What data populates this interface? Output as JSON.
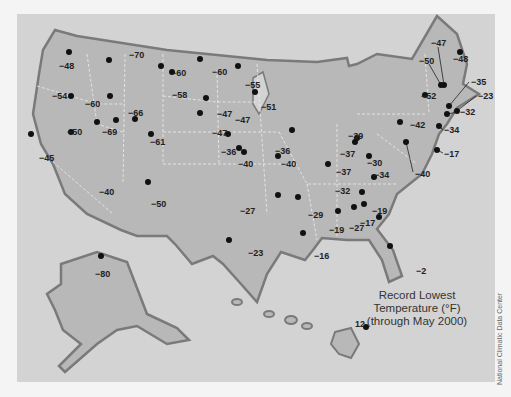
{
  "map": {
    "title_line1": "Record Lowest",
    "title_line2": "Temperature (°F)",
    "title_line3": "(through May 2000)",
    "credit": "National Climatic Data Center",
    "colors": {
      "background": "#f4f4f4",
      "ocean": "#d3d3d3",
      "land": "#b8b8b8",
      "border": "#7a7a7a",
      "marker": "#111111"
    }
  },
  "points": [
    {
      "v": "−48",
      "lx": 42,
      "ly": 48,
      "dx": 52,
      "dy": 38
    },
    {
      "v": "−54",
      "lx": 35,
      "ly": 78,
      "dx": 54,
      "dy": 82
    },
    {
      "v": "−60",
      "lx": 68,
      "ly": 86,
      "dx": 80,
      "dy": 108
    },
    {
      "v": "−70",
      "lx": 112,
      "ly": 37,
      "dx": 92,
      "dy": 46
    },
    {
      "v": "−60",
      "lx": 154,
      "ly": 55,
      "dx": 144,
      "dy": 52
    },
    {
      "v": "−66",
      "lx": 111,
      "ly": 95,
      "dx": 93,
      "dy": 82
    },
    {
      "v": "−58",
      "lx": 155,
      "ly": 77,
      "dx": 155,
      "dy": 58
    },
    {
      "v": "−60",
      "lx": 195,
      "ly": 54,
      "dx": 183,
      "dy": 45
    },
    {
      "v": "−55",
      "lx": 228,
      "ly": 67,
      "dx": 221,
      "dy": 52
    },
    {
      "v": "−51",
      "lx": 244,
      "ly": 89,
      "dx": 238,
      "dy": 78
    },
    {
      "v": "−47",
      "lx": 200,
      "ly": 96,
      "dx": 189,
      "dy": 84
    },
    {
      "v": "−47",
      "lx": 195,
      "ly": 115,
      "dx": 183,
      "dy": 99
    },
    {
      "v": "−36",
      "lx": 204,
      "ly": 134,
      "dx": 211,
      "dy": 120
    },
    {
      "v": "−50",
      "lx": 50,
      "ly": 114,
      "dx": 54,
      "dy": 118
    },
    {
      "v": "−45",
      "lx": 22,
      "ly": 140,
      "dx": 14,
      "dy": 120
    },
    {
      "v": "−69",
      "lx": 85,
      "ly": 114,
      "dx": 99,
      "dy": 106
    },
    {
      "v": "−61",
      "lx": 133,
      "ly": 124,
      "dx": 118,
      "dy": 105
    },
    {
      "v": "−40",
      "lx": 82,
      "ly": 174,
      "dx": 131,
      "dy": 168
    },
    {
      "v": "−50",
      "lx": 134,
      "ly": 186,
      "dx": 134,
      "dy": 120
    },
    {
      "v": "−47",
      "lx": 218,
      "ly": 102,
      "dx": 222,
      "dy": 134
    },
    {
      "v": "−40",
      "lx": 221,
      "ly": 146,
      "dx": 227,
      "dy": 138
    },
    {
      "v": "−40",
      "lx": 264,
      "ly": 146,
      "dx": 261,
      "dy": 142
    },
    {
      "v": "−36",
      "lx": 258,
      "ly": 133,
      "dx": 275,
      "dy": 116
    },
    {
      "v": "−39",
      "lx": 331,
      "ly": 118,
      "dx": 340,
      "dy": 124
    },
    {
      "v": "−37",
      "lx": 323,
      "ly": 136,
      "dx": 338,
      "dy": 128
    },
    {
      "v": "−37",
      "lx": 319,
      "ly": 154,
      "dx": 311,
      "dy": 150
    },
    {
      "v": "−42",
      "lx": 393,
      "ly": 107,
      "dx": 383,
      "dy": 108
    },
    {
      "v": "−30",
      "lx": 350,
      "ly": 145,
      "dx": 352,
      "dy": 142
    },
    {
      "v": "−40",
      "lx": 398,
      "ly": 156,
      "dx": 389,
      "dy": 128
    },
    {
      "v": "−17",
      "lx": 427,
      "ly": 136,
      "dx": 420,
      "dy": 136
    },
    {
      "v": "−34",
      "lx": 427,
      "ly": 112,
      "dx": 422,
      "dy": 112
    },
    {
      "v": "−34",
      "lx": 357,
      "ly": 157,
      "dx": 357,
      "dy": 163
    },
    {
      "v": "−32",
      "lx": 318,
      "ly": 173,
      "dx": 345,
      "dy": 178
    },
    {
      "v": "−27",
      "lx": 223,
      "ly": 193,
      "dx": 261,
      "dy": 181
    },
    {
      "v": "−29",
      "lx": 291,
      "ly": 197,
      "dx": 281,
      "dy": 183
    },
    {
      "v": "−19",
      "lx": 355,
      "ly": 193,
      "dx": 347,
      "dy": 190
    },
    {
      "v": "−19",
      "lx": 312,
      "ly": 212,
      "dx": 321,
      "dy": 197
    },
    {
      "v": "−27",
      "lx": 332,
      "ly": 210,
      "dx": 337,
      "dy": 193
    },
    {
      "v": "−17",
      "lx": 343,
      "ly": 205,
      "dx": 362,
      "dy": 203
    },
    {
      "v": "−16",
      "lx": 297,
      "ly": 238,
      "dx": 286,
      "dy": 219
    },
    {
      "v": "−23",
      "lx": 231,
      "ly": 235,
      "dx": 212,
      "dy": 226
    },
    {
      "v": "−2",
      "lx": 399,
      "ly": 253,
      "dx": 373,
      "dy": 232
    },
    {
      "v": "−47",
      "lx": 414,
      "ly": 25,
      "dx": 427,
      "dy": 71
    },
    {
      "v": "−50",
      "lx": 402,
      "ly": 43,
      "dx": 424,
      "dy": 71
    },
    {
      "v": "−48",
      "lx": 436,
      "ly": 41,
      "dx": 443,
      "dy": 38
    },
    {
      "v": "−35",
      "lx": 454,
      "ly": 64,
      "dx": 432,
      "dy": 92
    },
    {
      "v": "−23",
      "lx": 461,
      "ly": 78,
      "dx": 440,
      "dy": 97
    },
    {
      "v": "−52",
      "lx": 404,
      "ly": 78,
      "dx": 408,
      "dy": 81
    },
    {
      "v": "−32",
      "lx": 443,
      "ly": 94,
      "dx": 430,
      "dy": 100
    },
    {
      "v": "−80",
      "lx": 78,
      "ly": 256,
      "dx": 84,
      "dy": 242
    },
    {
      "v": "12",
      "lx": 338,
      "ly": 306,
      "dx": 349,
      "dy": 313
    }
  ]
}
